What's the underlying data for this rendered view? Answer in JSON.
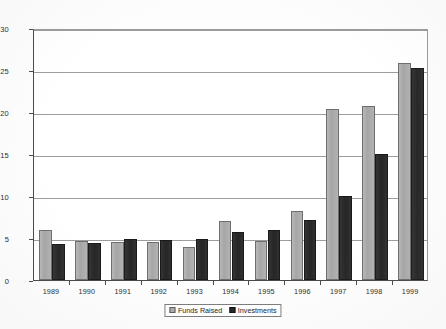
{
  "chart_data": {
    "type": "bar",
    "title": "",
    "subtitle": "",
    "xlabel": "",
    "ylabel": "",
    "ylim": [
      0,
      30
    ],
    "ytick_step": 5,
    "yticks": [
      "0",
      "5",
      "10",
      "15",
      "20",
      "25",
      "30"
    ],
    "grid": true,
    "legend_position": "bottom-center",
    "categories": [
      "1989",
      "1990",
      "1991",
      "1992",
      "1993",
      "1994",
      "1995",
      "1996",
      "1997",
      "1998",
      "1999"
    ],
    "series": [
      {
        "name": "Funds Raised",
        "color": "#adadad",
        "values": [
          5.9,
          4.6,
          4.5,
          4.5,
          3.9,
          7.0,
          4.7,
          8.2,
          20.3,
          20.7,
          25.8
        ]
      },
      {
        "name": "Investments",
        "color": "#262626",
        "values": [
          4.3,
          4.4,
          4.9,
          4.8,
          4.9,
          5.7,
          6.0,
          7.1,
          10.0,
          15.0,
          25.2
        ]
      }
    ]
  },
  "legend": {
    "items": [
      {
        "label": "Funds Raised",
        "swatch": "light-gray-swatch-icon"
      },
      {
        "label": "Investments",
        "swatch": "black-swatch-icon"
      }
    ]
  }
}
